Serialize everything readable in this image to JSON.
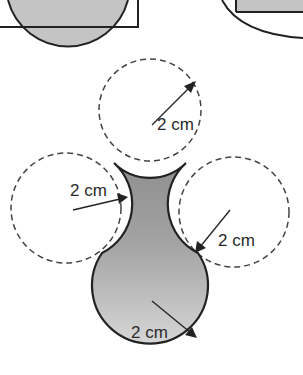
{
  "diagram": {
    "labels": {
      "top_circle": "2 cm",
      "left_circle": "2 cm",
      "right_circle": "2 cm",
      "bottom_circle": "2 cm"
    },
    "colors": {
      "fill_gray": "#bdbdbd",
      "fill_dark_gray": "#9e9e9e",
      "stroke": "#222222",
      "dashed": "#444444"
    }
  }
}
